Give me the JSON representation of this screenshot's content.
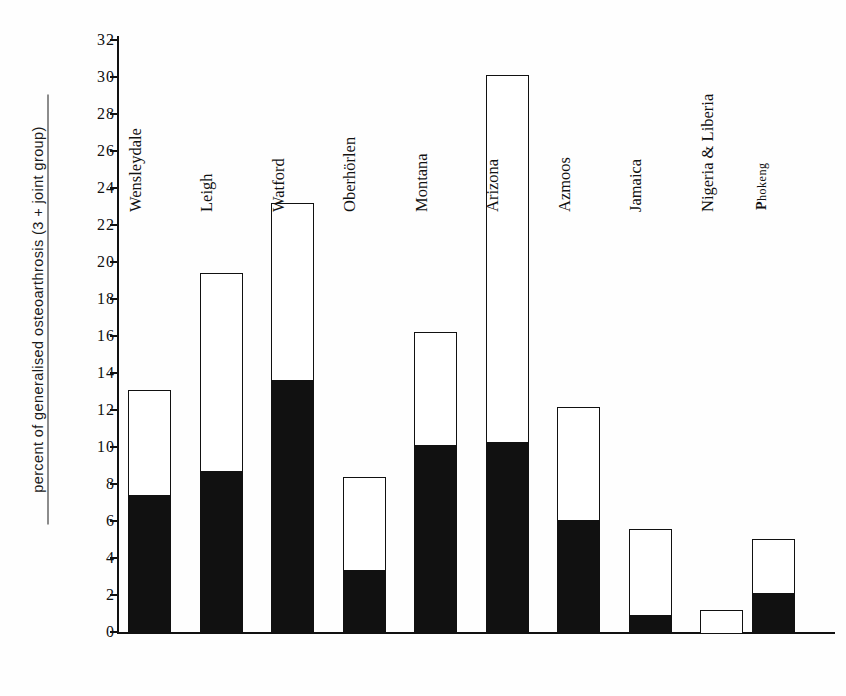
{
  "chart_data": {
    "type": "bar",
    "title": "",
    "subtitle": "",
    "xlabel": "",
    "ylabel": "percent of generalised osteoarthrosis (3 + joint group)",
    "ylim": [
      0,
      32
    ],
    "ytick_step": 2,
    "ytick_labels": [
      "0",
      "2",
      "4",
      "6",
      "8",
      "10",
      "12",
      "14",
      "16",
      "18",
      "20",
      "22",
      "24",
      "26",
      "28",
      "30",
      "32"
    ],
    "grid": false,
    "legend_position": "none",
    "stacked": true,
    "categories": [
      "Wensleydale",
      "Leigh",
      "Watford",
      "Oberhörlen",
      "Montana",
      "Arizona",
      "Azmoos",
      "Jamaica",
      "Nigeria & Liberia",
      "Phokeng"
    ],
    "series": [
      {
        "name": "filled (solid black segment)",
        "color": "#111111",
        "values": [
          7.45,
          8.75,
          13.7,
          3.4,
          10.15,
          10.35,
          6.1,
          1.0,
          0.0,
          2.15
        ]
      },
      {
        "name": "open (white upper segment) — total bar height",
        "color": "#ffffff",
        "values": [
          13.2,
          19.5,
          23.3,
          8.5,
          16.3,
          30.2,
          12.25,
          5.65,
          1.3,
          5.15
        ]
      }
    ],
    "totals": [
      13.2,
      19.5,
      23.3,
      8.5,
      16.3,
      30.2,
      12.25,
      5.65,
      1.3,
      5.15
    ]
  },
  "labels": {
    "bars": [
      {
        "text": "Wensleydale",
        "style": "normal"
      },
      {
        "text": "Leigh",
        "style": "normal"
      },
      {
        "text": "Watford",
        "style": "normal"
      },
      {
        "text": "Oberhörlen",
        "style": "normal"
      },
      {
        "text": "Montana",
        "style": "normal"
      },
      {
        "text": "Arizona",
        "style": "normal"
      },
      {
        "text": "Azmoos",
        "style": "normal"
      },
      {
        "text": "Jamaica",
        "style": "normal"
      },
      {
        "text": "Nigeria & Liberia",
        "style": "normal"
      },
      {
        "text": "Phokeng",
        "style": "small"
      }
    ]
  },
  "colors": {
    "ink": "#111111",
    "paper": "#ffffff",
    "fill_dark": "#111111",
    "fill_open": "#ffffff"
  }
}
